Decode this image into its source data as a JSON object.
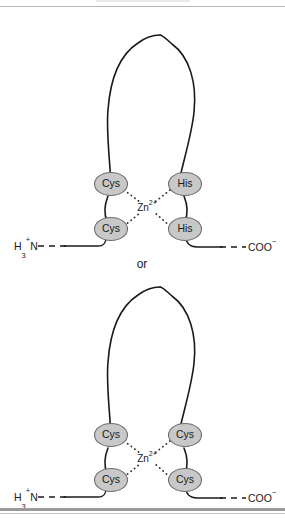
{
  "figure": {
    "separator_label": "or",
    "metal_label": {
      "element": "Zn",
      "charge": "2+"
    },
    "termini": {
      "n_terminus": {
        "main": "H",
        "sub": "3",
        "sup": "+",
        "tail": "N"
      },
      "c_terminus": {
        "main": "COO",
        "sup": "−"
      }
    },
    "motifs": [
      {
        "id": "cys2-his2",
        "name": "Cys2-His2 zinc finger",
        "residues": [
          {
            "label": "Cys",
            "position": "upper-left"
          },
          {
            "label": "Cys",
            "position": "lower-left"
          },
          {
            "label": "His",
            "position": "upper-right"
          },
          {
            "label": "His",
            "position": "lower-right"
          }
        ]
      },
      {
        "id": "cys4",
        "name": "Cys4 zinc finger",
        "residues": [
          {
            "label": "Cys",
            "position": "upper-left"
          },
          {
            "label": "Cys",
            "position": "lower-left"
          },
          {
            "label": "Cys",
            "position": "upper-right"
          },
          {
            "label": "Cys",
            "position": "lower-right"
          }
        ]
      }
    ]
  },
  "colors": {
    "residue_fill": "#c8c8c8",
    "residue_stroke": "#6d6d6d",
    "chain": "#1a1a1a",
    "rule": "#9a9a9a"
  }
}
